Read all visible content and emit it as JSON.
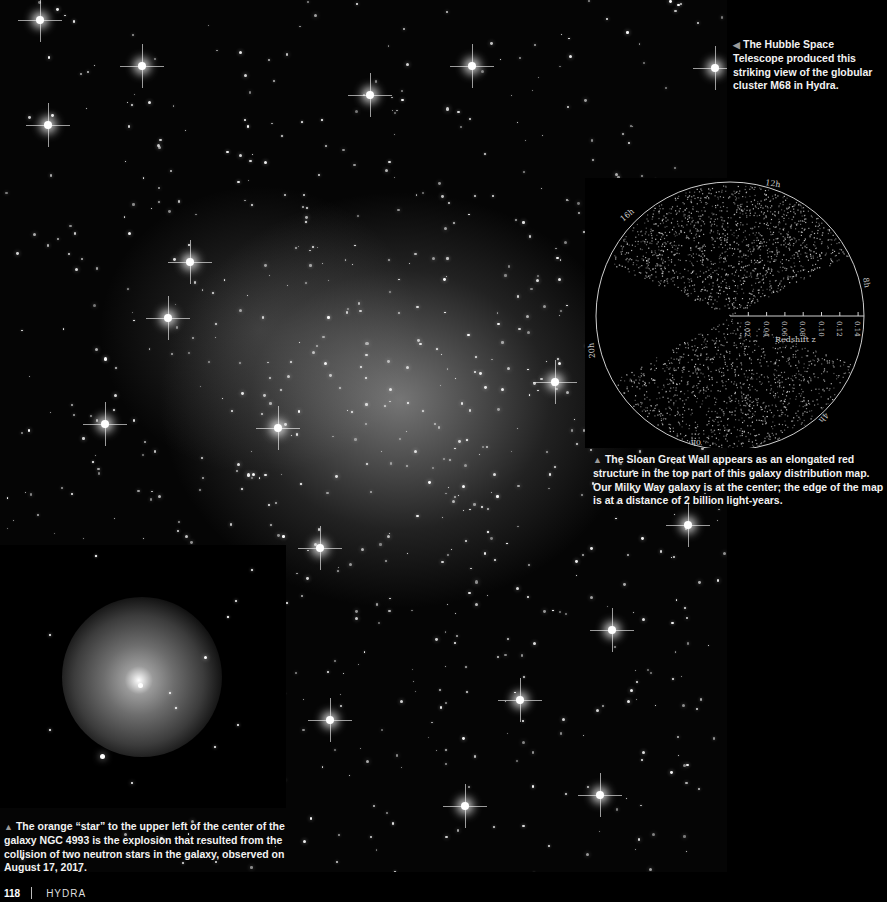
{
  "page": {
    "number": "118",
    "chapter": "HYDRA"
  },
  "images": {
    "main": {
      "subject": "globular cluster M68 in Hydra",
      "source": "Hubble Space Telescope"
    },
    "sdss_map": {
      "subject": "galaxy distribution map (Sloan Great Wall)",
      "hour_labels": [
        "12h",
        "16h",
        "8h",
        "20h",
        "4h",
        "0h"
      ],
      "axis_label": "Redshift z",
      "axis_ticks": [
        "0.02",
        "0.04",
        "0.06",
        "0.08",
        "0.10",
        "0.12",
        "0.14"
      ]
    },
    "galaxy": {
      "subject": "galaxy NGC 4993"
    }
  },
  "captions": {
    "hubble": {
      "marker": "◀",
      "text": "The Hubble Space Telescope produced this striking view of the globular cluster M68 in Hydra."
    },
    "sdss": {
      "marker": "▲",
      "text": "The Sloan Great Wall appears as an elongated red structure in the top part of this galaxy distribution map. Our Milky Way galaxy is at the center; the edge of the map is at a distance of 2 billion light-years."
    },
    "galaxy": {
      "marker": "▲",
      "text": "The orange “star” to the upper left of the center of the galaxy NGC 4993 is the explosion that resulted from the collision of two neutron stars in the galaxy, observed on August 17, 2017."
    }
  }
}
